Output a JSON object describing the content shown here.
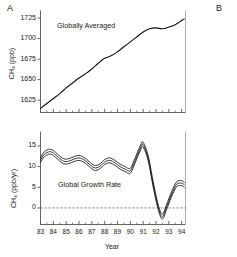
{
  "figure": {
    "panel_a_letter": "A",
    "panel_b_letter": "B",
    "xlabel": "Year"
  },
  "chart_data": [
    {
      "type": "line",
      "panel": "A",
      "title": "Globally Averaged",
      "xlabel": "Year",
      "ylabel": "CH4 (ppb)",
      "ylabel_display": "CH₄ (ppb)",
      "xlim": [
        83,
        94.3
      ],
      "ylim": [
        1610,
        1733
      ],
      "yticks": [
        1625,
        1650,
        1675,
        1700,
        1725
      ],
      "ytick_labels": [
        "1625",
        "1650",
        "1675",
        "1700",
        "1725"
      ],
      "xticks": [
        83,
        84,
        85,
        86,
        87,
        88,
        89,
        90,
        91,
        92,
        93,
        94
      ],
      "xtick_labels": [
        "83",
        "84",
        "85",
        "86",
        "87",
        "88",
        "89",
        "90",
        "91",
        "92",
        "93",
        "94"
      ],
      "grid": false,
      "legend": "none",
      "frame": "left-bottom-open",
      "annotation": "Globally Averaged",
      "x": [
        83.0,
        83.5,
        84.0,
        84.5,
        85.0,
        85.5,
        86.0,
        86.5,
        87.0,
        87.5,
        88.0,
        88.5,
        89.0,
        89.5,
        90.0,
        90.5,
        91.0,
        91.5,
        92.0,
        92.5,
        93.0,
        93.5,
        94.0,
        94.2
      ],
      "values": [
        1615,
        1621,
        1627,
        1633,
        1640,
        1646,
        1652,
        1657,
        1663,
        1670,
        1676,
        1679,
        1684,
        1690,
        1696,
        1702,
        1708,
        1712,
        1713,
        1712,
        1714,
        1717,
        1722,
        1724
      ]
    },
    {
      "type": "line",
      "panel": "A-lower",
      "title": "Global Growth Rate",
      "xlabel": "Year",
      "ylabel": "CH4 (ppb/yr)",
      "ylabel_display": "CH₄ (ppb/yr)",
      "xlim": [
        83,
        94.3
      ],
      "ylim": [
        -4,
        18
      ],
      "yticks": [
        0,
        5,
        10,
        15
      ],
      "ytick_labels": [
        "0",
        "5",
        "10",
        "15"
      ],
      "xticks": [
        83,
        84,
        85,
        86,
        87,
        88,
        89,
        90,
        91,
        92,
        93,
        94
      ],
      "xtick_labels": [
        "83",
        "84",
        "85",
        "86",
        "87",
        "88",
        "89",
        "90",
        "91",
        "92",
        "93",
        "94"
      ],
      "grid": false,
      "zero_line": true,
      "zero_line_style": "dashed",
      "legend": "none",
      "annotation": "Global Growth Rate",
      "series": [
        {
          "name": "upper uncertainty",
          "x": [
            83.0,
            83.3,
            83.7,
            84.0,
            84.4,
            84.8,
            85.2,
            85.6,
            86.0,
            86.4,
            86.8,
            87.2,
            87.6,
            88.0,
            88.4,
            88.8,
            89.2,
            89.6,
            90.0,
            90.4,
            90.8,
            91.0,
            91.4,
            91.8,
            92.2,
            92.5,
            92.8,
            93.2,
            93.6,
            94.0,
            94.2
          ],
          "values": [
            12.2,
            13.6,
            14.2,
            13.9,
            12.8,
            11.9,
            11.9,
            12.4,
            12.7,
            12.2,
            11.2,
            10.3,
            10.6,
            11.7,
            12.1,
            11.5,
            10.6,
            10.0,
            9.6,
            12.3,
            15.2,
            15.9,
            12.5,
            6.0,
            0.5,
            -1.5,
            0.6,
            3.8,
            6.3,
            6.6,
            6.2
          ]
        },
        {
          "name": "central estimate",
          "x": [
            83.0,
            83.3,
            83.7,
            84.0,
            84.4,
            84.8,
            85.2,
            85.6,
            86.0,
            86.4,
            86.8,
            87.2,
            87.6,
            88.0,
            88.4,
            88.8,
            89.2,
            89.6,
            90.0,
            90.4,
            90.8,
            91.0,
            91.4,
            91.8,
            92.2,
            92.5,
            92.8,
            93.2,
            93.6,
            94.0,
            94.2
          ],
          "values": [
            11.6,
            13.0,
            13.6,
            13.3,
            12.2,
            11.3,
            11.3,
            11.8,
            12.1,
            11.6,
            10.6,
            9.7,
            10.0,
            11.1,
            11.5,
            10.9,
            10.0,
            9.4,
            9.0,
            11.7,
            14.6,
            15.3,
            11.9,
            5.4,
            -0.1,
            -2.1,
            0.0,
            3.2,
            5.7,
            6.0,
            5.6
          ]
        },
        {
          "name": "lower uncertainty",
          "x": [
            83.0,
            83.3,
            83.7,
            84.0,
            84.4,
            84.8,
            85.2,
            85.6,
            86.0,
            86.4,
            86.8,
            87.2,
            87.6,
            88.0,
            88.4,
            88.8,
            89.2,
            89.6,
            90.0,
            90.4,
            90.8,
            91.0,
            91.4,
            91.8,
            92.2,
            92.5,
            92.8,
            93.2,
            93.6,
            94.0,
            94.2
          ],
          "values": [
            11.0,
            12.4,
            13.0,
            12.7,
            11.6,
            10.7,
            10.7,
            11.2,
            11.5,
            11.0,
            10.0,
            9.1,
            9.4,
            10.5,
            10.9,
            10.3,
            9.4,
            8.8,
            8.4,
            11.1,
            14.0,
            14.7,
            11.3,
            4.8,
            -0.7,
            -2.7,
            -0.6,
            2.6,
            5.1,
            5.4,
            5.0
          ]
        }
      ]
    }
  ]
}
